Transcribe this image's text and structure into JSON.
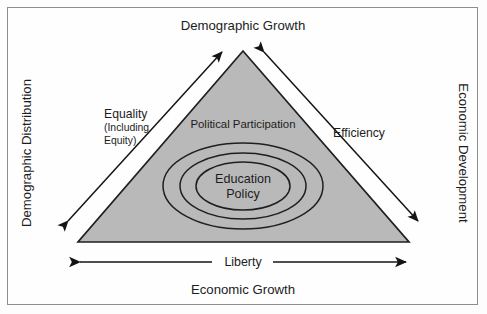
{
  "figure": {
    "type": "conceptual-triangle-diagram",
    "border_color": "#8d8d8d",
    "background_color": "#fefefe"
  },
  "outer_labels": {
    "top": "Demographic Growth",
    "bottom": "Economic Growth",
    "left": "Demographic Distribution",
    "right": "Economic Development"
  },
  "triangle": {
    "fill_color": "#b9b9b9",
    "stroke_color": "#1f1f1f",
    "inner_top_label": "Political Participation"
  },
  "corner_labels": {
    "left_main": "Equality",
    "left_sub_line1": "(Including",
    "left_sub_line2": "Equity)",
    "right": "Efficiency"
  },
  "base_axis": {
    "label": "Liberty"
  },
  "core": {
    "line1": "Education",
    "line2": "Policy",
    "ring_count": 3
  },
  "arrows": {
    "left_diagonal_name": "equality-double-arrow",
    "right_diagonal_name": "efficiency-double-arrow",
    "base_name": "liberty-double-arrow"
  }
}
